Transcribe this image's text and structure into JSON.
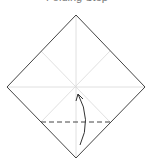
{
  "title": "Folding Step",
  "diagram": {
    "paper_outline_color": "#444444",
    "crease_color": "#d8d8d8",
    "valley_fold_color": "#444444",
    "arrow_color": "#333333",
    "annotations": [
      "valley fold line",
      "fold-up arrow"
    ]
  }
}
